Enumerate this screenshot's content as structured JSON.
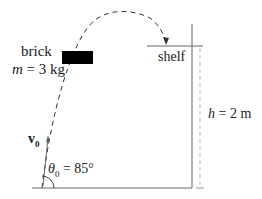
{
  "diagram": {
    "brick_label": "brick",
    "mass_var": "m",
    "mass_value": " = 3 kg",
    "shelf_label": "shelf",
    "height_var": "h",
    "height_value": " = 2 m",
    "velocity_label": "v",
    "velocity_sub": "0",
    "angle_var": "θ",
    "angle_sub": "0",
    "angle_value": " = 85°"
  },
  "colors": {
    "line": "#555555",
    "brick": "#000000",
    "text": "#222222"
  }
}
